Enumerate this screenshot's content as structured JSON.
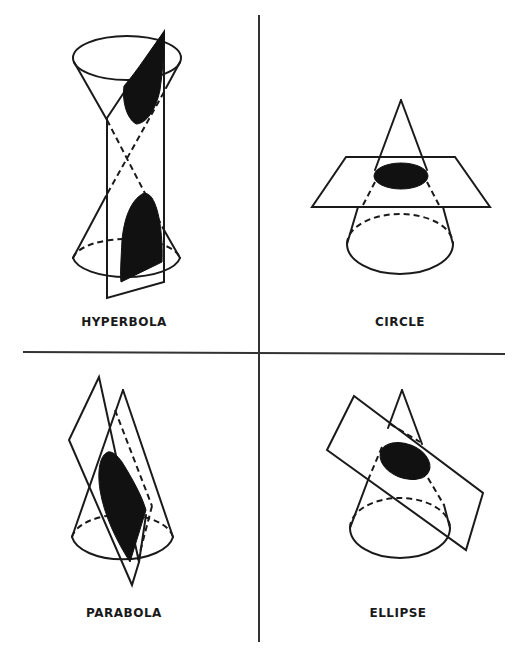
{
  "figure": {
    "layout": "2x2 grid",
    "line_color": "#1a1a1a",
    "fill_color": "#111111",
    "background": "#ffffff"
  },
  "panels": [
    {
      "id": "hyperbola",
      "label": "HYPERBOLA",
      "position": "top-left",
      "description": "Double cone cut by a vertical plane parallel to the axis; two shaded branches"
    },
    {
      "id": "circle",
      "label": "CIRCLE",
      "position": "top-right",
      "description": "Cone cut by a horizontal plane perpendicular to the axis; shaded circular section"
    },
    {
      "id": "parabola",
      "label": "PARABOLA",
      "position": "bottom-left",
      "description": "Cone cut by a tilted plane parallel to a generator; shaded open section"
    },
    {
      "id": "ellipse",
      "label": "ELLIPSE",
      "position": "bottom-right",
      "description": "Cone cut by an oblique plane; shaded closed elliptical section"
    }
  ]
}
